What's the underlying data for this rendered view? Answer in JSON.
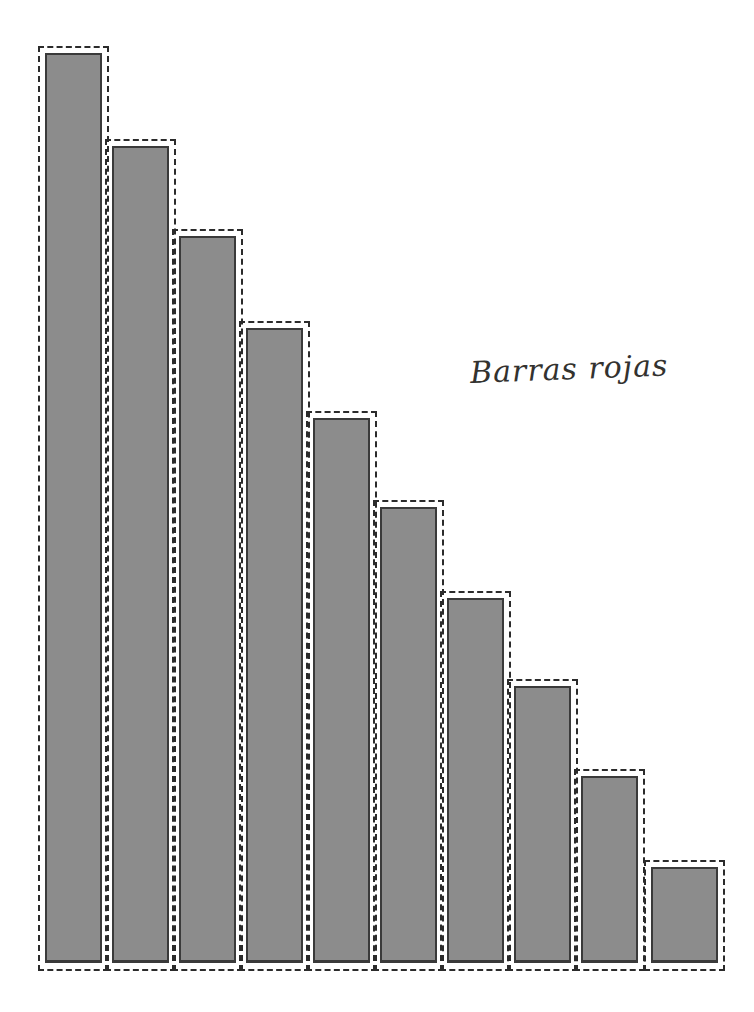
{
  "canvas": {
    "width": 754,
    "height": 1012,
    "background": "#ffffff"
  },
  "annotation": {
    "label_text": "Barras rojas",
    "label_x": 470,
    "label_y": 355,
    "ink_color": "#33322f"
  },
  "style": {
    "bar_fill": "#8c8c8c",
    "bar_border": "#3a3a3a",
    "selection_dash_color": "#2b2b2b",
    "baseline_y": 963
  },
  "chart_data": {
    "type": "bar",
    "title": "Barras rojas",
    "xlabel": "",
    "ylabel": "",
    "grid": false,
    "legend": "none",
    "categories": [
      "1",
      "2",
      "3",
      "4",
      "5",
      "6",
      "7",
      "8",
      "9",
      "10"
    ],
    "values": [
      910,
      817,
      727,
      635,
      545,
      456,
      365,
      277,
      187,
      96
    ],
    "ylim": [
      0,
      960
    ],
    "bars": [
      {
        "index": 1,
        "value": 910,
        "left": 38,
        "top": 46,
        "width": 71,
        "height": 925
      },
      {
        "index": 2,
        "value": 817,
        "left": 105,
        "top": 139,
        "width": 71,
        "height": 832
      },
      {
        "index": 3,
        "value": 727,
        "left": 172,
        "top": 229,
        "width": 71,
        "height": 742
      },
      {
        "index": 4,
        "value": 635,
        "left": 239,
        "top": 321,
        "width": 71,
        "height": 650
      },
      {
        "index": 5,
        "value": 545,
        "left": 306,
        "top": 411,
        "width": 71,
        "height": 560
      },
      {
        "index": 6,
        "value": 456,
        "left": 373,
        "top": 500,
        "width": 71,
        "height": 471
      },
      {
        "index": 7,
        "value": 365,
        "left": 440,
        "top": 591,
        "width": 71,
        "height": 380
      },
      {
        "index": 8,
        "value": 277,
        "left": 507,
        "top": 679,
        "width": 71,
        "height": 292
      },
      {
        "index": 9,
        "value": 187,
        "left": 574,
        "top": 769,
        "width": 71,
        "height": 202
      },
      {
        "index": 10,
        "value": 96,
        "left": 644,
        "top": 860,
        "width": 81,
        "height": 111
      }
    ]
  }
}
